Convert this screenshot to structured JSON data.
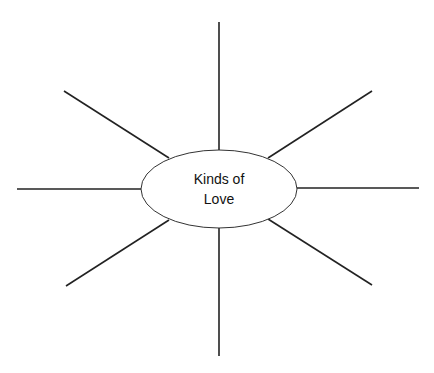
{
  "diagram": {
    "type": "concept-map",
    "center": {
      "line1": "Kinds of",
      "line2": "Love",
      "cx": 219,
      "cy": 189,
      "rx": 78,
      "ry": 39
    },
    "spokes": [
      {
        "name": "top",
        "x1": 219,
        "y1": 22,
        "x2": 219,
        "y2": 150
      },
      {
        "name": "upper-right",
        "x1": 372,
        "y1": 91,
        "x2": 268,
        "y2": 158
      },
      {
        "name": "right",
        "x1": 297,
        "y1": 188,
        "x2": 419,
        "y2": 188
      },
      {
        "name": "lower-right",
        "x1": 268,
        "y1": 219,
        "x2": 372,
        "y2": 285
      },
      {
        "name": "bottom",
        "x1": 219,
        "y1": 228,
        "x2": 219,
        "y2": 356
      },
      {
        "name": "lower-left",
        "x1": 169,
        "y1": 220,
        "x2": 66,
        "y2": 286
      },
      {
        "name": "left",
        "x1": 17,
        "y1": 189,
        "x2": 141,
        "y2": 189
      },
      {
        "name": "upper-left",
        "x1": 64,
        "y1": 91,
        "x2": 169,
        "y2": 158
      }
    ],
    "colors": {
      "line": "#222222",
      "background": "#ffffff"
    }
  }
}
